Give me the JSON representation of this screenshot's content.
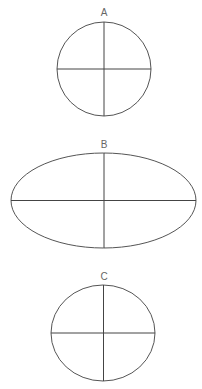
{
  "diagram": {
    "figures": [
      {
        "label": "A",
        "shape": "circle",
        "cx": 104,
        "cy": 69,
        "rx": 47,
        "ry": 47,
        "label_y": 16
      },
      {
        "label": "B",
        "shape": "ellipse",
        "cx": 103.5,
        "cy": 200.5,
        "rx": 92.5,
        "ry": 47.5,
        "label_y": 148
      },
      {
        "label": "C",
        "shape": "ellipse",
        "cx": 103,
        "cy": 333,
        "rx": 52,
        "ry": 48,
        "label_y": 280
      }
    ],
    "stroke_color": "#555555",
    "background": "#ffffff"
  }
}
